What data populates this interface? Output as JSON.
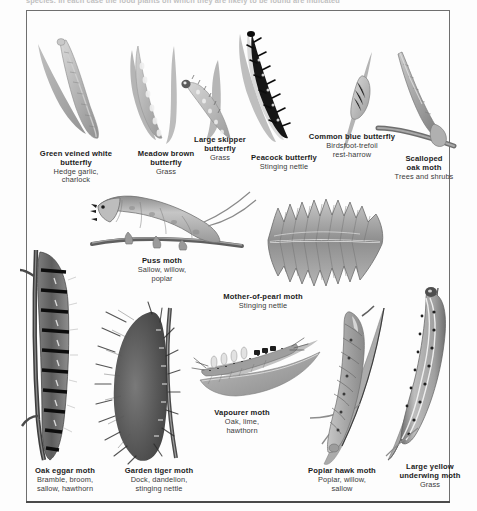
{
  "page": {
    "cut_header_text": "species. In each case the food plants on which they are likely to be found are indicated",
    "background_hex": "#fdfdfd",
    "ink_hex": "#1b1b1b",
    "border_hex": "#6f6f6f"
  },
  "figures": [
    {
      "id": "green-veined-white-butterfly",
      "name": "Green veined white\nbutterfly",
      "name_line1": "Green veined white",
      "name_line2": "butterfly",
      "food": "Hedge garlic,\ncharlock",
      "food_line1": "Hedge garlic,",
      "food_line2": "charlock",
      "caption_left": 22,
      "caption_top": 150,
      "caption_width": 108
    },
    {
      "id": "meadow-brown-butterfly",
      "name_line1": "Meadow brown",
      "name_line2": "butterfly",
      "food_line1": "Grass",
      "food_line2": "",
      "caption_left": 120,
      "caption_top": 150,
      "caption_width": 92
    },
    {
      "id": "large-skipper-butterfly",
      "name_line1": "Large skipper",
      "name_line2": "butterfly",
      "food_line1": "Grass",
      "food_line2": "",
      "caption_left": 178,
      "caption_top": 136,
      "caption_width": 84
    },
    {
      "id": "peacock-butterfly",
      "name_line1": "Peacock butterfly",
      "name_line2": "",
      "food_line1": "Stinging nettle",
      "food_line2": "",
      "caption_left": 238,
      "caption_top": 154,
      "caption_width": 92
    },
    {
      "id": "common-blue-butterfly",
      "name_line1": "Common blue butterfly",
      "name_line2": "",
      "food_line1": "Birdsfoot-trefoil",
      "food_line2": "rest-harrow",
      "caption_left": 296,
      "caption_top": 133,
      "caption_width": 112
    },
    {
      "id": "scalloped-oak-moth",
      "name_line1": "Scalloped",
      "name_line2": "oak moth",
      "food_line1": "Trees and shrubs",
      "food_line2": "",
      "caption_left": 376,
      "caption_top": 155,
      "caption_width": 96
    },
    {
      "id": "puss-moth",
      "name_line1": "Puss moth",
      "name_line2": "",
      "food_line1": "Sallow, willow,",
      "food_line2": "poplar",
      "caption_left": 117,
      "caption_top": 257,
      "caption_width": 90
    },
    {
      "id": "mother-of-pearl-moth",
      "name_line1": "Mother-of-pearl moth",
      "name_line2": "",
      "food_line1": "Stinging nettle",
      "food_line2": "",
      "caption_left": 208,
      "caption_top": 293,
      "caption_width": 110
    },
    {
      "id": "oak-eggar-moth",
      "name_line1": "Oak eggar moth",
      "name_line2": "",
      "food_line1": "Bramble, broom,",
      "food_line2": "sallow, hawthorn",
      "caption_left": 18,
      "caption_top": 467,
      "caption_width": 94
    },
    {
      "id": "garden-tiger-moth",
      "name_line1": "Garden tiger moth",
      "name_line2": "",
      "food_line1": "Dock, dandelion,",
      "food_line2": "stinging nettle",
      "caption_left": 110,
      "caption_top": 467,
      "caption_width": 98
    },
    {
      "id": "vapourer-moth",
      "name_line1": "Vapourer moth",
      "name_line2": "",
      "food_line1": "Oak, lime,",
      "food_line2": "hawthorn",
      "caption_left": 198,
      "caption_top": 409,
      "caption_width": 88
    },
    {
      "id": "poplar-hawk-moth",
      "name_line1": "Poplar hawk moth",
      "name_line2": "",
      "food_line1": "Poplar, willow,",
      "food_line2": "sallow",
      "caption_left": 294,
      "caption_top": 467,
      "caption_width": 96
    },
    {
      "id": "large-yellow-underwing-moth",
      "name_line1": "Large yellow",
      "name_line2": "underwing moth",
      "food_line1": "Grass",
      "food_line2": "",
      "caption_left": 386,
      "caption_top": 463,
      "caption_width": 88
    }
  ]
}
